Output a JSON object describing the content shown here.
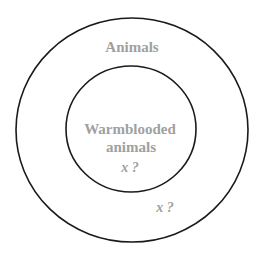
{
  "diagram": {
    "type": "venn-nested",
    "colors": {
      "stroke": "#1a1a1a",
      "label": "#a0a0a0",
      "background": "#ffffff"
    },
    "outer_set": {
      "label": "Animals",
      "variable": "x ?"
    },
    "inner_set": {
      "label_line1": "Warmblooded",
      "label_line2": "animals",
      "variable": "x ?"
    }
  }
}
